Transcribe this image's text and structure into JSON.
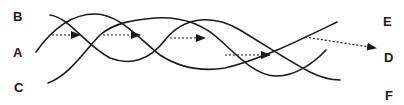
{
  "labels": {
    "left": {
      "top": "B",
      "middle": "A",
      "bottom": "C"
    },
    "right": {
      "top": "E",
      "middle": "D",
      "bottom": "F"
    }
  },
  "colors": {
    "stroke": "#1a1a1a",
    "background": "#ffffff"
  },
  "curves": [
    {
      "id": "A",
      "description": "starts middle-left, rises and weaves to upper-right"
    },
    {
      "id": "B",
      "description": "starts top-left, descends and weaves"
    },
    {
      "id": "C",
      "description": "starts bottom-left, rises and weaves"
    }
  ],
  "arrows": [
    {
      "from": [
        52,
        35
      ],
      "to": [
        80,
        35
      ]
    },
    {
      "from": [
        103,
        35
      ],
      "to": [
        140,
        35
      ]
    },
    {
      "from": [
        170,
        38
      ],
      "to": [
        205,
        38
      ]
    },
    {
      "from": [
        225,
        55
      ],
      "to": [
        270,
        55
      ]
    },
    {
      "from": [
        305,
        37
      ],
      "to": [
        376,
        48
      ]
    }
  ]
}
